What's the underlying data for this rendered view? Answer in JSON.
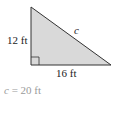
{
  "diagram": {
    "type": "right-triangle",
    "fill_color": "#d9d9d9",
    "stroke_color": "#333333",
    "vertical_leg_label": "12 ft",
    "horizontal_leg_label": "16 ft",
    "hypotenuse_label": "c",
    "right_angle_marker": "square"
  },
  "answer": {
    "variable": "c",
    "equals": "=",
    "value": "20 ft"
  }
}
